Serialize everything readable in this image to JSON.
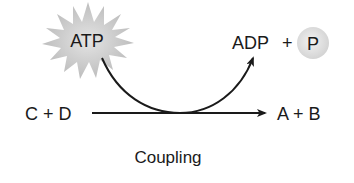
{
  "diagram": {
    "title": "Coupling",
    "energy_source": {
      "label": "ATP",
      "shape": "starburst",
      "fill": "#c9c9c9"
    },
    "products_of_source": {
      "adp": "ADP",
      "plus": "+",
      "phosphate": "P",
      "phosphate_fill": "#e2e2e2"
    },
    "reaction": {
      "reactants": "C + D",
      "products": "A + B"
    },
    "colors": {
      "line": "#1a1a1a",
      "text": "#1a1a1a",
      "background": "#ffffff"
    }
  }
}
